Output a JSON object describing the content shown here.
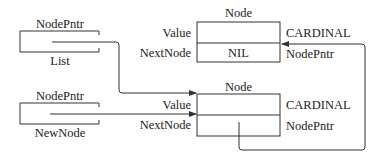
{
  "diagram": {
    "pointer_vars": [
      {
        "id": "list",
        "type_label": "NodePntr",
        "name_label": "List"
      },
      {
        "id": "newnode",
        "type_label": "NodePntr",
        "name_label": "NewNode"
      }
    ],
    "nodes": [
      {
        "id": "node-top",
        "title": "Node",
        "fields": [
          {
            "name": "Value",
            "content": "",
            "type": "CARDINAL"
          },
          {
            "name": "NextNode",
            "content": "NIL",
            "type": "NodePntr"
          }
        ]
      },
      {
        "id": "node-bottom",
        "title": "Node",
        "fields": [
          {
            "name": "Value",
            "content": "",
            "type": "CARDINAL"
          },
          {
            "name": "NextNode",
            "content": "",
            "type": "NodePntr"
          }
        ]
      }
    ],
    "edges": [
      {
        "from": "List",
        "to": "node-bottom"
      },
      {
        "from": "NewNode",
        "to": "node-bottom"
      },
      {
        "from": "node-bottom.NextNode",
        "to": "node-top"
      }
    ],
    "colors": {
      "line": "#333333",
      "background": "#ffffff"
    }
  }
}
